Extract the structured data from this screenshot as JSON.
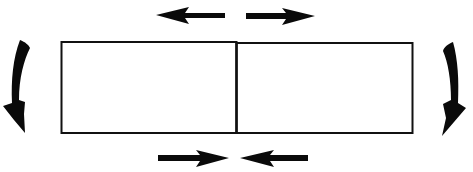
{
  "diagram": {
    "colors": {
      "background": "#ffffff",
      "stroke": "#111111",
      "fill": "#0a0a0a"
    },
    "beam": {
      "x": 61,
      "y": 42,
      "width": 352,
      "height": 91,
      "divider_x": 236,
      "segments": [
        {
          "name": "left-segment"
        },
        {
          "name": "right-segment"
        }
      ]
    },
    "arrows": {
      "top_left": {
        "direction": "left",
        "meaning": "tension",
        "x1": 225,
        "x2": 156,
        "y": 15
      },
      "top_right": {
        "direction": "right",
        "meaning": "tension",
        "x1": 246,
        "x2": 315,
        "y": 16
      },
      "bottom_left": {
        "direction": "right",
        "meaning": "compression",
        "x1": 158,
        "x2": 229,
        "y": 158
      },
      "bottom_right": {
        "direction": "left",
        "meaning": "compression",
        "x1": 308,
        "x2": 240,
        "y": 158
      },
      "moment_left": {
        "direction": "curved-down",
        "side": "left"
      },
      "moment_right": {
        "direction": "curved-down",
        "side": "right"
      }
    }
  }
}
